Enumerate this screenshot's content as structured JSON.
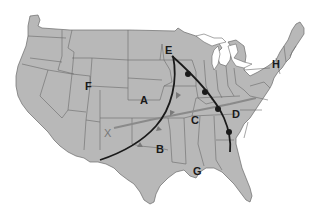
{
  "map": {
    "title": "",
    "land_color": "#b8b8b8",
    "border_color": "#6a6a6a",
    "water_color": "#ffffff",
    "front_color": "#1a1a1a",
    "stationary_line_color": "#8a8a8a",
    "labels": [
      {
        "id": "A",
        "text": "A",
        "x": 140,
        "y": 100
      },
      {
        "id": "B",
        "text": "B",
        "x": 156,
        "y": 148
      },
      {
        "id": "C",
        "text": "C",
        "x": 190,
        "y": 116
      },
      {
        "id": "D",
        "text": "D",
        "x": 232,
        "y": 113
      },
      {
        "id": "E",
        "text": "E",
        "x": 168,
        "y": 44
      },
      {
        "id": "F",
        "text": "F",
        "x": 85,
        "y": 82
      },
      {
        "id": "G",
        "text": "G",
        "x": 192,
        "y": 167
      },
      {
        "id": "H",
        "text": "H",
        "x": 275,
        "y": 61
      },
      {
        "id": "X",
        "text": "X",
        "x": 104,
        "y": 133
      }
    ],
    "fronts": [
      {
        "name": "cold-front",
        "type": "cold",
        "symbol": "triangles",
        "description": "Curved front from E arcing southwest to near B"
      },
      {
        "name": "occluded-warm-front",
        "type": "warm",
        "symbol": "semicircles",
        "description": "Front from E curving southeast through D to Alabama"
      },
      {
        "name": "gray-line",
        "type": "line",
        "symbol": "none",
        "description": "Gray line from X eastward across C and D"
      }
    ]
  }
}
